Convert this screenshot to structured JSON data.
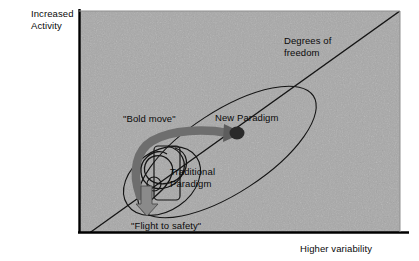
{
  "figure": {
    "type": "conceptual-diagram",
    "background_color": "#ffffff",
    "plot_fill_color": "#a9a9a9",
    "frame_color": "#000000",
    "ink_color": "#111111",
    "arrow_color": "#6e6e6e"
  },
  "axes": {
    "y_label_line1": "Increased",
    "y_label_line2": "Activity",
    "x_label": "Higher variability"
  },
  "annotations": {
    "degrees_line1": "Degrees of",
    "degrees_line2": "freedom",
    "bold_move": "\"Bold move\"",
    "new_paradigm": "New Paradigm",
    "traditional_line1": "Traditional",
    "traditional_line2": "Paradigm",
    "flight_to_safety": "\"Flight to safety\""
  },
  "shapes": {
    "diagonal_name": "degrees-of-freedom-line",
    "large_ellipse_name": "new-paradigm-envelope",
    "small_ellipse_name": "traditional-paradigm-envelope",
    "arrow_name": "bold-move-arrow",
    "spiral_name": "flight-to-safety-spiral",
    "node_name": "new-paradigm-node"
  }
}
